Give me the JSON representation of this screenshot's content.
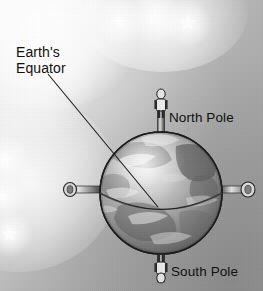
{
  "scene": {
    "title": "Earth globe diagram with equator, north pole and south pole",
    "width": 263,
    "height": 291,
    "background_style": "grayscale starry gradient",
    "colors": {
      "background_light": "#fdfdfd",
      "background_dark": "#a2a2a2",
      "globe_light": "#d8d8d8",
      "globe_mid": "#9a9a9a",
      "globe_dark": "#4f4f4f",
      "outline": "#1c1c1c",
      "text": "#101010",
      "star": "#ffffff"
    }
  },
  "labels": {
    "equator": "Earth's\nEquator",
    "equator_line1": "Earth's",
    "equator_line2": "Equator",
    "north_pole": "North Pole",
    "south_pole": "South Pole"
  },
  "icons": {
    "globe": "globe-icon",
    "equator_line": "equator-line-icon",
    "leader_line": "leader-line-icon",
    "north_figure": "person-standing-icon",
    "south_figure": "person-hanging-icon",
    "axis_pin_left": "axle-pin-icon",
    "axis_pin_right": "axle-pin-icon",
    "axis_rod_north": "axis-rod-icon",
    "axis_rod_south": "axis-rod-icon",
    "star": "star-icon"
  },
  "globe": {
    "center_x": 161,
    "center_y": 193,
    "radius": 61,
    "equator_tilt": "front-low ellipse"
  },
  "stars": [
    {
      "name": "star-top-left",
      "x": 120,
      "y": 22,
      "size": 20,
      "halo": 46
    },
    {
      "name": "star-top-center",
      "x": 155,
      "y": 18,
      "size": 24,
      "halo": 52
    },
    {
      "name": "star-top-right",
      "x": 188,
      "y": 23,
      "size": 22,
      "halo": 48
    },
    {
      "name": "star-left-upper",
      "x": 5,
      "y": 160,
      "size": 22,
      "halo": 50
    },
    {
      "name": "star-left-middle",
      "x": 2,
      "y": 196,
      "size": 20,
      "halo": 46
    },
    {
      "name": "star-left-lower",
      "x": 9,
      "y": 233,
      "size": 21,
      "halo": 48
    }
  ],
  "leader_line": {
    "from_x": 48,
    "from_y": 74,
    "to_x": 158,
    "to_y": 207
  }
}
